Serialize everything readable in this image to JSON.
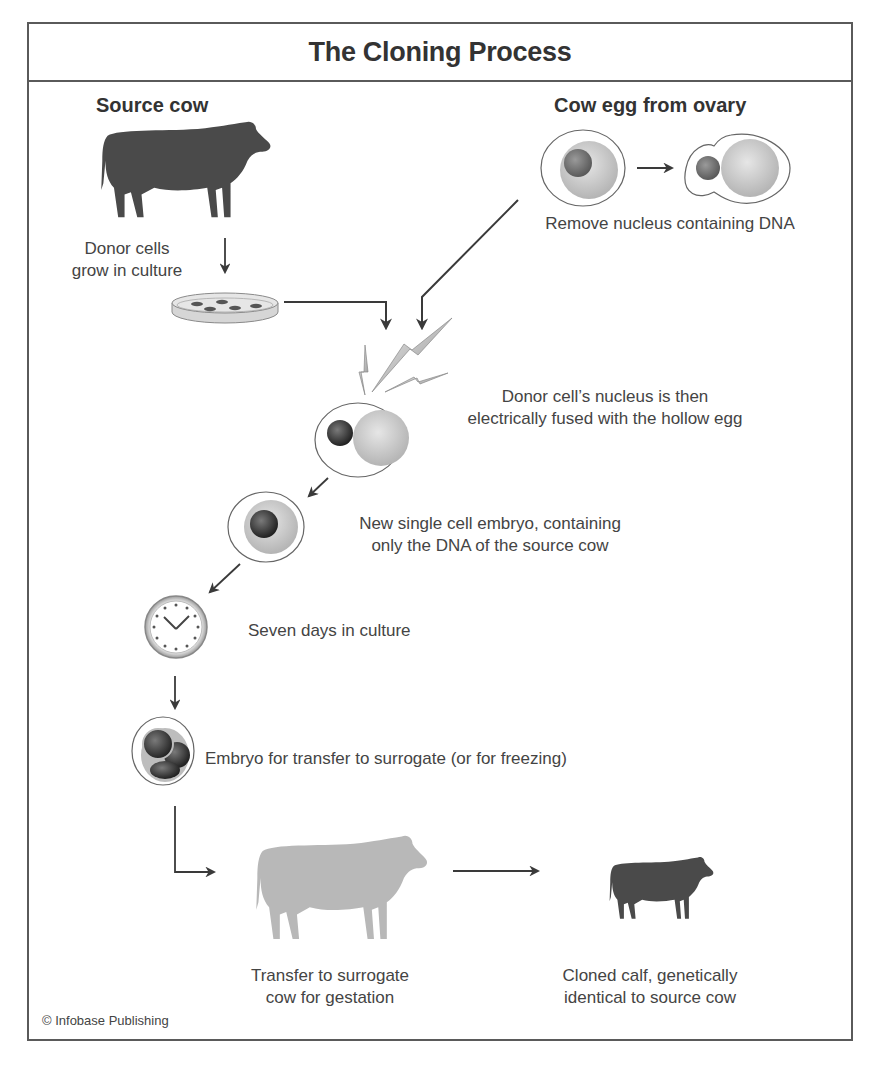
{
  "diagram": {
    "title": "The Cloning Process",
    "colors": {
      "frame": "#5a5a5a",
      "source_cow": "#4a4a4a",
      "surrogate_cow": "#b8b8b8",
      "calf": "#4a4a4a",
      "arrow": "#3a3a3a",
      "cytoplasm": "#c8c8c8",
      "nucleus": "#6a6a6a",
      "donor_nucleus": "#2f2f2f"
    },
    "headings": {
      "source_cow": "Source cow",
      "cow_egg": "Cow egg from ovary"
    },
    "steps": [
      {
        "id": "donor-cells",
        "label_lines": [
          "Donor cells",
          "grow in culture"
        ],
        "icon": "petri-dish-icon"
      },
      {
        "id": "remove-nucleus",
        "label_lines": [
          "Remove nucleus containing DNA"
        ],
        "icon": "egg-cell-icon"
      },
      {
        "id": "fusion",
        "label_lines": [
          "Donor cell’s nucleus is then",
          "electrically fused with the hollow egg"
        ],
        "icon": "lightning-bolt-icon"
      },
      {
        "id": "single-cell-embryo",
        "label_lines": [
          "New single cell embryo, containing",
          "only the DNA of the source cow"
        ],
        "icon": "embryo-cell-icon"
      },
      {
        "id": "culture",
        "label_lines": [
          "Seven days in culture"
        ],
        "icon": "clock-icon"
      },
      {
        "id": "embryo-transfer",
        "label_lines": [
          "Embryo for transfer to surrogate (or for freezing)"
        ],
        "icon": "multicell-embryo-icon"
      },
      {
        "id": "surrogate",
        "label_lines": [
          "Transfer to surrogate",
          "cow for gestation"
        ],
        "icon": "surrogate-cow-icon"
      },
      {
        "id": "calf",
        "label_lines": [
          "Cloned calf, genetically",
          "identical to source cow"
        ],
        "icon": "calf-icon"
      }
    ],
    "credit": "© Infobase Publishing"
  }
}
